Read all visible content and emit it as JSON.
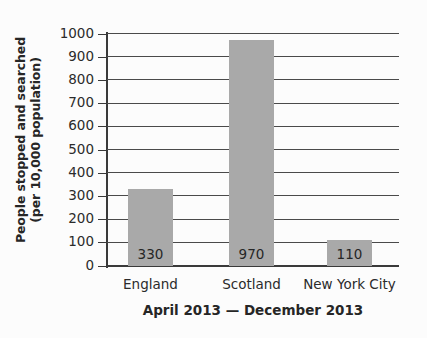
{
  "chart_data": {
    "type": "bar",
    "title": "April 2013 — December 2013",
    "xlabel": "",
    "ylabel": "People stopped and searched (per 10,000 population)",
    "ylabel_line1": "People stopped and searched",
    "ylabel_line2": "(per 10,000 population)",
    "categories": [
      "England",
      "Scotland",
      "New York City"
    ],
    "values": [
      330,
      970,
      110
    ],
    "value_labels": [
      "330",
      "970",
      "110"
    ],
    "ylim": [
      0,
      1000
    ],
    "ytick_step": 100,
    "ytick_labels": [
      "1000",
      "900",
      "800",
      "700",
      "600",
      "500",
      "400",
      "300",
      "200",
      "100",
      "0"
    ],
    "ytick_values": [
      1000,
      900,
      800,
      700,
      600,
      500,
      400,
      300,
      200,
      100,
      0
    ],
    "grid": true,
    "legend": false,
    "bar_color": "#a9a9a9",
    "axis_color": "#3a3a3a",
    "grid_color": "#4a4a4a",
    "text_color": "#262626",
    "background_color": "#fcfcfc"
  }
}
